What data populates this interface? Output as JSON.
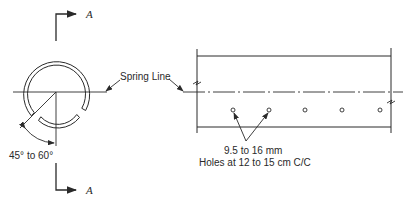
{
  "section_markers": {
    "top_label": "A",
    "bottom_label": "A"
  },
  "cross_section": {
    "angle_label": "45° to 60°"
  },
  "spring_line": {
    "label": "Spring Line"
  },
  "longitudinal_view": {
    "hole_size_label": "9.5 to 16 mm",
    "hole_spacing_label": "Holes at 12 to 15 cm C/C",
    "hole_count": 5
  },
  "colors": {
    "line": "#2a2a2a",
    "background": "#ffffff"
  }
}
